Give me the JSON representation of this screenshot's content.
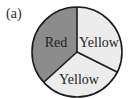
{
  "figure": {
    "panel_label": "(a)",
    "type": "spinner",
    "center": [
      77,
      52
    ],
    "radius": 45,
    "colors": {
      "outline": "#1a1a1a",
      "dark_section": "#8c8c8c",
      "light_section": "#ececec",
      "text": "#1e1e1e"
    },
    "sections": [
      {
        "label": "Red",
        "fill": "#8c8c8c"
      },
      {
        "label": "Yellow",
        "fill": "#ececec"
      },
      {
        "label": "Yellow",
        "fill": "#ececec"
      }
    ]
  }
}
